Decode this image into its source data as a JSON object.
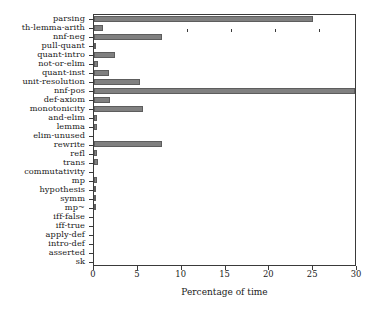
{
  "chart_data": {
    "type": "bar",
    "orientation": "horizontal",
    "title": "",
    "xlabel": "Percentage of time",
    "ylabel": "",
    "xlim": [
      0,
      30
    ],
    "xticks": [
      0,
      5,
      10,
      15,
      20,
      25,
      30
    ],
    "xtick_labels": [
      "0",
      "5",
      "10",
      "15",
      "20",
      "25",
      "30"
    ],
    "grid": false,
    "legend": null,
    "bar_color": "#808080",
    "bar_edge_color": "#5d5d5d",
    "axis_color": "#3a3a3a",
    "categories": [
      "parsing",
      "th-lemma-arith",
      "nnf-neg",
      "pull-quant",
      "quant-intro",
      "not-or-elim",
      "quant-inst",
      "unit-resolution",
      "nnf-pos",
      "def-axiom",
      "monotonicity",
      "and-elim",
      "lemma",
      "elim-unused",
      "rewrite",
      "refl",
      "trans",
      "commutativity",
      "mp",
      "hypothesis",
      "symm",
      "mp~",
      "iff-false",
      "iff-true",
      "apply-def",
      "intro-def",
      "asserted",
      "sk"
    ],
    "values": [
      25.0,
      1.0,
      7.7,
      0.05,
      2.4,
      0.5,
      1.7,
      5.3,
      30.0,
      1.8,
      5.6,
      0.3,
      0.3,
      0.0,
      7.8,
      0.35,
      0.45,
      0.0,
      0.3,
      0.15,
      0.1,
      0.1,
      0.0,
      0.0,
      0.0,
      0.0,
      0.0,
      0.0
    ]
  }
}
